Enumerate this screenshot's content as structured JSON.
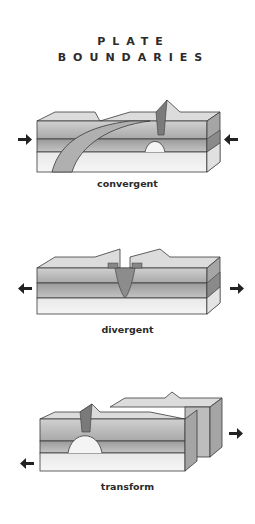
{
  "title": {
    "line1": "PLATE",
    "line2": "BOUNDARIES"
  },
  "diagrams": [
    {
      "id": "convergent",
      "label": "convergent",
      "arrows": [
        "right-pointing arrow (left side)",
        "left-pointing arrow (right side)"
      ]
    },
    {
      "id": "divergent",
      "label": "divergent",
      "arrows": [
        "left-pointing arrow (left side)",
        "right-pointing arrow (right side)"
      ]
    },
    {
      "id": "transform",
      "label": "transform",
      "arrows": [
        "left-pointing arrow (lower left)",
        "right-pointing arrow (right side)"
      ]
    }
  ],
  "colors": {
    "text": "#2a2a2a",
    "layer_top": "#bdbdbd",
    "layer_mid": "#9a9a9a",
    "layer_bottom": "#e6e6e6",
    "outline": "#3a3a3a",
    "arrow": "#222222"
  }
}
